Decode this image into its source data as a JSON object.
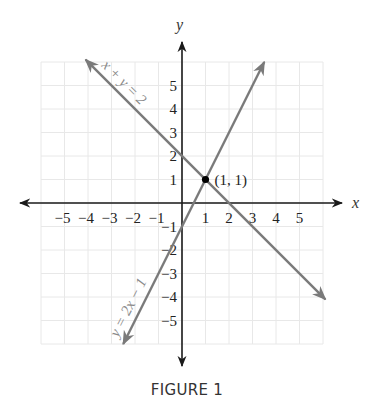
{
  "caption": "FIGURE 1",
  "colors": {
    "axis": "#1a1a1a",
    "line": "#7a7a7a",
    "grid": "#e8e8e8",
    "point": "#000000"
  },
  "chart_data": {
    "type": "line",
    "title": "FIGURE 1",
    "xlabel": "x",
    "ylabel": "y",
    "xlim": [
      -6,
      6
    ],
    "ylim": [
      -6,
      6
    ],
    "grid": true,
    "x_ticks": [
      -5,
      -4,
      -3,
      -2,
      -1,
      1,
      2,
      3,
      4,
      5
    ],
    "y_ticks": [
      5,
      4,
      3,
      2,
      1,
      -1,
      -2,
      -3,
      -4,
      -5
    ],
    "x_tick_labels": [
      "−5",
      "−4",
      "−3",
      "−2",
      "−1",
      "1",
      "2",
      "3",
      "4",
      "5"
    ],
    "y_tick_labels": [
      "5",
      "4",
      "3",
      "2",
      "1",
      "−1",
      "−2",
      "−3",
      "−4",
      "−5"
    ],
    "series": [
      {
        "name": "x + y = 2",
        "equation": "x + y = 2",
        "points": [
          [
            -4.1,
            6.1
          ],
          [
            6.1,
            -4.1
          ]
        ],
        "arrows": "both"
      },
      {
        "name": "y = 2x − 1",
        "equation": "y = 2x − 1",
        "points": [
          [
            -2.5,
            -6.0
          ],
          [
            3.5,
            6.0
          ]
        ],
        "arrows": "both"
      }
    ],
    "annotations": [
      {
        "type": "point",
        "x": 1,
        "y": 1,
        "label": "(1, 1)"
      }
    ]
  }
}
